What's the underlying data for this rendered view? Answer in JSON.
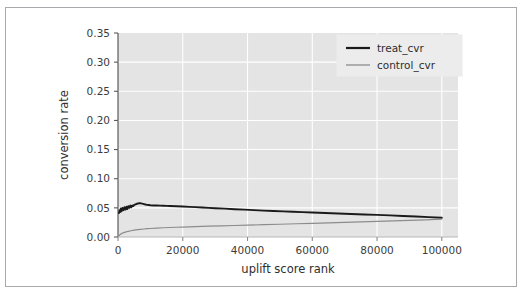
{
  "figure": {
    "width": 524,
    "height": 298,
    "background_color": "#ffffff",
    "border_color": "#a9a9ad",
    "plot_background_color": "#e4e4e4",
    "grid_color": "#ffffff"
  },
  "chart_data": {
    "type": "line",
    "title": "",
    "xlabel": "uplift score rank",
    "ylabel": "conversion rate",
    "xlim": [
      0,
      105000
    ],
    "ylim": [
      0.0,
      0.35
    ],
    "xticks": [
      0,
      20000,
      40000,
      60000,
      80000,
      100000
    ],
    "xticklabels": [
      "0",
      "20000",
      "40000",
      "60000",
      "80000",
      "100000"
    ],
    "yticks": [
      0.0,
      0.05,
      0.1,
      0.15,
      0.2,
      0.25,
      0.3,
      0.35
    ],
    "yticklabels": [
      "0.00",
      "0.05",
      "0.10",
      "0.15",
      "0.20",
      "0.25",
      "0.30",
      "0.35"
    ],
    "grid": true,
    "legend_position": "upper right",
    "series": [
      {
        "name": "treat_cvr",
        "color": "#1a1a1a",
        "linewidth": 1.9,
        "x": [
          300,
          500,
          700,
          900,
          1100,
          1400,
          1700,
          2000,
          2300,
          2600,
          2900,
          3200,
          3500,
          3800,
          4100,
          4400,
          4700,
          5000,
          5400,
          5800,
          6200,
          6600,
          7000,
          7500,
          8000,
          8500,
          9000,
          9500,
          10000,
          11000,
          12000,
          13000,
          14000,
          15000,
          16000,
          18000,
          20000,
          22000,
          24000,
          26000,
          28000,
          30000,
          33000,
          36000,
          39000,
          42000,
          45000,
          48000,
          51000,
          54000,
          57000,
          60000,
          64000,
          68000,
          72000,
          76000,
          80000,
          84000,
          88000,
          92000,
          96000,
          100000
        ],
        "y": [
          0.041,
          0.046,
          0.043,
          0.049,
          0.044,
          0.05,
          0.046,
          0.051,
          0.047,
          0.052,
          0.048,
          0.053,
          0.05,
          0.054,
          0.051,
          0.054,
          0.053,
          0.055,
          0.056,
          0.057,
          0.0575,
          0.058,
          0.0578,
          0.0572,
          0.0565,
          0.0558,
          0.0552,
          0.0549,
          0.0545,
          0.0541,
          0.054,
          0.0538,
          0.0536,
          0.0534,
          0.0532,
          0.0527,
          0.0522,
          0.0517,
          0.0512,
          0.0506,
          0.05,
          0.0494,
          0.0486,
          0.0477,
          0.0469,
          0.0461,
          0.0453,
          0.0446,
          0.0439,
          0.0432,
          0.0426,
          0.042,
          0.0411,
          0.0403,
          0.0395,
          0.0387,
          0.0379,
          0.0371,
          0.0361,
          0.0351,
          0.0341,
          0.0331
        ]
      },
      {
        "name": "control_cvr",
        "color": "#8c8c8c",
        "linewidth": 1.2,
        "x": [
          300,
          700,
          1200,
          1800,
          2500,
          3200,
          4000,
          5000,
          6000,
          7000,
          8000,
          9000,
          10000,
          12000,
          14000,
          16000,
          18000,
          20000,
          24000,
          28000,
          32000,
          36000,
          40000,
          45000,
          50000,
          55000,
          60000,
          65000,
          70000,
          75000,
          80000,
          85000,
          90000,
          95000,
          100000
        ],
        "y": [
          0.0022,
          0.0045,
          0.0062,
          0.0076,
          0.0088,
          0.0098,
          0.0107,
          0.0117,
          0.0125,
          0.0131,
          0.0137,
          0.0142,
          0.0146,
          0.0153,
          0.0159,
          0.0163,
          0.0167,
          0.0171,
          0.0178,
          0.0185,
          0.0191,
          0.0197,
          0.0203,
          0.0211,
          0.0219,
          0.0227,
          0.0235,
          0.0243,
          0.0251,
          0.0259,
          0.0267,
          0.0276,
          0.0285,
          0.0295,
          0.0308
        ]
      }
    ]
  },
  "legend": {
    "items": [
      {
        "label": "treat_cvr",
        "color": "#1a1a1a",
        "linewidth": 2.2
      },
      {
        "label": "control_cvr",
        "color": "#8c8c8c",
        "linewidth": 1.3
      }
    ]
  }
}
